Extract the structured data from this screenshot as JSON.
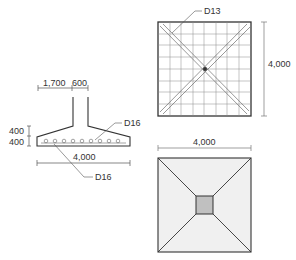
{
  "drawing": {
    "type": "footing-detail",
    "section": {
      "dim_left": "1,700",
      "dim_column": "600",
      "dim_height_upper": "400",
      "dim_height_lower": "400",
      "dim_width": "4,000",
      "rebar_top_label": "D16",
      "rebar_bottom_label": "D16"
    },
    "rebar_plan": {
      "rebar_label": "D13",
      "dim_height": "4,000"
    },
    "footing_plan": {
      "dim_width": "4,000"
    }
  },
  "colors": {
    "line": "#333333",
    "grid": "#777777",
    "fill_plan": "#f0f0f0",
    "fill_column": "#c0c0c0"
  }
}
